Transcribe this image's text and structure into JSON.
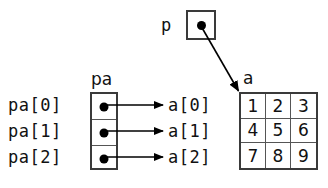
{
  "diagram": {
    "colors": {
      "box_border": "#3a3a3a",
      "cell_divider": "#555555",
      "dot": "#000000",
      "arrow": "#000000",
      "background": "#ffffff",
      "text": "#111111"
    },
    "pointer_p": {
      "label": "p",
      "cell_value": "",
      "points_to": "a"
    },
    "pa_array": {
      "header": "pa",
      "row_labels": [
        "pa[0]",
        "pa[1]",
        "pa[2]"
      ],
      "cell_values": [
        "",
        "",
        ""
      ],
      "targets": [
        "a[0]",
        "a[1]",
        "a[2]"
      ]
    },
    "a_matrix": {
      "header": "a",
      "row_labels": [
        "a[0]",
        "a[1]",
        "a[2]"
      ],
      "rows": [
        [
          "1",
          "2",
          "3"
        ],
        [
          "4",
          "5",
          "6"
        ],
        [
          "7",
          "8",
          "9"
        ]
      ]
    }
  }
}
